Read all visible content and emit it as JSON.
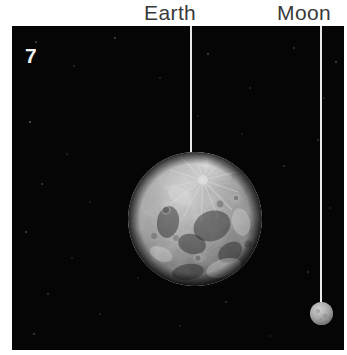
{
  "figure": {
    "panel_number": "7",
    "background_color": "#050505",
    "page_background": "#ffffff",
    "label_color": "#3a3a3a",
    "leader_line_color": "#e8e8e8"
  },
  "labels": [
    {
      "id": "earth",
      "text": "Earth"
    },
    {
      "id": "moon",
      "text": "Moon"
    }
  ],
  "bodies": [
    {
      "id": "earth",
      "name": "Earth",
      "appearance": "large grayscale cratered sphere, bright radial ray system near top",
      "base_color": "#8d8d8d",
      "highlight_color": "#d4d4d4",
      "shadow_color": "#1b1b1b"
    },
    {
      "id": "moon",
      "name": "Moon",
      "appearance": "small gray sphere",
      "base_color": "#9a9a9a",
      "highlight_color": "#c2c2c2",
      "shadow_color": "#4a4a4a"
    }
  ]
}
